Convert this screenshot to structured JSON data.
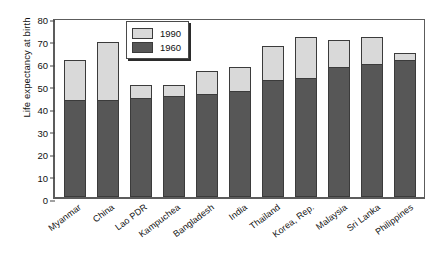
{
  "chart_data": {
    "type": "bar",
    "subtype": "stacked-overlay",
    "title": "",
    "xlabel": "",
    "ylabel": "Life expectancy at birth",
    "ylim": [
      0,
      80
    ],
    "yticks": [
      0,
      10,
      20,
      30,
      40,
      50,
      60,
      70,
      80
    ],
    "grid": false,
    "legend_position": "upper-center-left",
    "categories": [
      "Myanmar",
      "China",
      "Lao PDR",
      "Kampuchea",
      "Bangladesh",
      "India",
      "Thailand",
      "Korea, Rep.",
      "Malaysia",
      "Sri Lanka",
      "Philippines"
    ],
    "series": [
      {
        "name": "1990",
        "color": "#d9d9d9",
        "values": [
          61,
          69,
          50,
          50,
          56,
          58,
          67,
          71,
          70,
          71,
          64
        ]
      },
      {
        "name": "1960",
        "color": "#575757",
        "values": [
          43,
          43,
          44,
          45,
          46,
          47,
          52,
          53,
          58,
          59,
          61
        ]
      }
    ]
  },
  "legend": {
    "entries": [
      {
        "label": "1990",
        "color": "#d9d9d9"
      },
      {
        "label": "1960",
        "color": "#575757"
      }
    ]
  }
}
